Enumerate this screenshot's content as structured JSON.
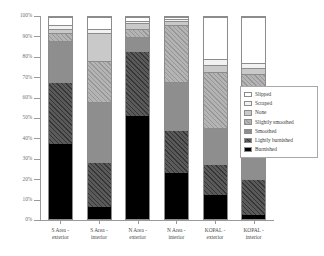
{
  "chart_data": {
    "type": "bar",
    "stacked": true,
    "stack_mode": "percent",
    "title": "",
    "xlabel": "",
    "ylabel": "",
    "ylim": [
      0,
      100
    ],
    "ytick_labels": [
      "100%",
      "90%",
      "80%",
      "70%",
      "60%",
      "50%",
      "40%",
      "30%",
      "20%",
      "10%",
      "0%"
    ],
    "ytick_values": [
      100,
      90,
      80,
      70,
      60,
      50,
      40,
      30,
      20,
      10,
      0
    ],
    "grid": false,
    "legend_position": "right",
    "categories": [
      "S Area - exterior",
      "S Area - interior",
      "N Area - exterior",
      "N Area - interior",
      "KOPAL - exterior",
      "KOPAL - interior"
    ],
    "category_lines": [
      [
        "S Area -",
        "exterior"
      ],
      [
        "S Area -",
        "interior"
      ],
      [
        "N Area -",
        "exterior"
      ],
      [
        "N Area -",
        "interior"
      ],
      [
        "KOPAL -",
        "exterior"
      ],
      [
        "KOPAL -",
        "interior"
      ]
    ],
    "series": [
      {
        "name": "Burnished",
        "key": "burnished",
        "color": "#000000",
        "values": [
          37,
          6,
          51,
          23,
          12,
          2
        ]
      },
      {
        "name": "Lightly burnished",
        "key": "lightly-burnished",
        "color": "#5a5a5a",
        "values": [
          31,
          22,
          32,
          21,
          15,
          18
        ]
      },
      {
        "name": "Smoothed",
        "key": "smoothed",
        "color": "#8e8e8e",
        "values": [
          20,
          30,
          7,
          24,
          18,
          28
        ]
      },
      {
        "name": "Slightly smoothed",
        "key": "slightly-smoothed",
        "color": "#b4b4b4",
        "values": [
          4,
          20,
          4,
          28,
          28,
          24
        ]
      },
      {
        "name": "None",
        "key": "none",
        "color": "#c9c9c9",
        "values": [
          2,
          14,
          3,
          2,
          3,
          3
        ]
      },
      {
        "name": "Scraped",
        "key": "scraped",
        "color": "#f2f2f2",
        "values": [
          2,
          2,
          1,
          1,
          3,
          2
        ]
      },
      {
        "name": "Slipped",
        "key": "slipped",
        "color": "#ffffff",
        "values": [
          4,
          6,
          2,
          1,
          21,
          23
        ]
      }
    ],
    "legend_entries": [
      {
        "label": "Slipped",
        "key": "slipped"
      },
      {
        "label": "Scraped",
        "key": "scraped"
      },
      {
        "label": "None",
        "key": "none"
      },
      {
        "label": "Slightly smoothed",
        "key": "slightly-smoothed"
      },
      {
        "label": "Smoothed",
        "key": "smoothed"
      },
      {
        "label": "Lightly burnished",
        "key": "lightly-burnished"
      },
      {
        "label": "Burnished",
        "key": "burnished"
      }
    ]
  }
}
